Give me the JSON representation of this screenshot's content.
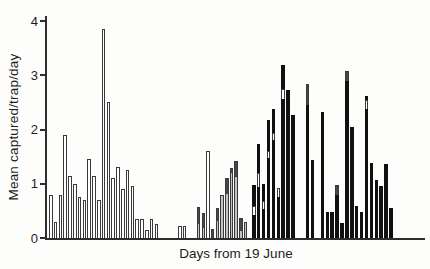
{
  "figure": {
    "kind": "scanned bar chart figure",
    "background": "#fdfdfc"
  },
  "chart_data": {
    "type": "bar",
    "title": "",
    "xlabel": "Days from 19 June",
    "ylabel": "Mean captured/trap/day",
    "ylim": [
      0,
      4
    ],
    "yticks": [
      0,
      1,
      2,
      3,
      4
    ],
    "x_tick_labels": "none shown",
    "grid": "off",
    "legend": "none",
    "bar_width_px": 3.6,
    "px_per_unit": 54.25,
    "baseline_y_px": 238,
    "colors": {
      "open": "#ffffff",
      "light": "#c3c3c3",
      "dark": "#474747",
      "black": "#101010",
      "outline": "#3a3a3a",
      "axis": "#2e2e2e"
    },
    "groups": [
      {
        "name": "period-1-open-bars",
        "fill_style": "open (white, outlined)",
        "bars": [
          {
            "x": 49.0,
            "segments": [
              [
                "open",
                0.8
              ]
            ]
          },
          {
            "x": 53.8,
            "segments": [
              [
                "open",
                0.3
              ]
            ]
          },
          {
            "x": 58.6,
            "segments": [
              [
                "open",
                0.8
              ]
            ]
          },
          {
            "x": 63.4,
            "segments": [
              [
                "open",
                1.9
              ]
            ]
          },
          {
            "x": 68.2,
            "segments": [
              [
                "open",
                1.15
              ]
            ]
          },
          {
            "x": 73.0,
            "segments": [
              [
                "open",
                1.0
              ]
            ]
          },
          {
            "x": 77.8,
            "segments": [
              [
                "open",
                0.75
              ]
            ]
          },
          {
            "x": 82.6,
            "segments": [
              [
                "open",
                0.7
              ]
            ]
          },
          {
            "x": 87.4,
            "segments": [
              [
                "open",
                1.45
              ]
            ]
          },
          {
            "x": 92.2,
            "segments": [
              [
                "open",
                1.15
              ]
            ]
          },
          {
            "x": 97.0,
            "segments": [
              [
                "open",
                0.7
              ]
            ]
          },
          {
            "x": 101.8,
            "segments": [
              [
                "open",
                3.85
              ]
            ]
          },
          {
            "x": 106.6,
            "segments": [
              [
                "open",
                2.5
              ]
            ]
          },
          {
            "x": 111.4,
            "segments": [
              [
                "open",
                1.1
              ]
            ]
          },
          {
            "x": 116.2,
            "segments": [
              [
                "open",
                1.3
              ]
            ]
          },
          {
            "x": 121.0,
            "segments": [
              [
                "open",
                0.9
              ]
            ]
          },
          {
            "x": 125.8,
            "segments": [
              [
                "open",
                1.25
              ]
            ]
          },
          {
            "x": 130.6,
            "segments": [
              [
                "open",
                0.95
              ]
            ]
          },
          {
            "x": 135.4,
            "segments": [
              [
                "open",
                0.35
              ]
            ]
          },
          {
            "x": 140.2,
            "segments": [
              [
                "open",
                0.35
              ]
            ]
          },
          {
            "x": 145.0,
            "segments": [
              [
                "open",
                0.15
              ]
            ]
          },
          {
            "x": 149.8,
            "segments": [
              [
                "open",
                0.35
              ]
            ]
          },
          {
            "x": 154.6,
            "segments": [
              [
                "open",
                0.25
              ]
            ]
          }
        ]
      },
      {
        "name": "period-2-gray-stacked-bars",
        "fill_style": "light gray with dark gray top segments; some open",
        "bars": [
          {
            "x": 178.0,
            "segments": [
              [
                "open",
                0.22
              ]
            ]
          },
          {
            "x": 182.7,
            "segments": [
              [
                "open",
                0.22
              ]
            ]
          },
          {
            "x": 196.8,
            "segments": [
              [
                "light",
                0.28
              ],
              [
                "dark",
                0.29
              ]
            ]
          },
          {
            "x": 201.5,
            "segments": [
              [
                "light",
                0.2
              ],
              [
                "dark",
                0.25
              ]
            ]
          },
          {
            "x": 206.2,
            "segments": [
              [
                "open",
                1.6
              ]
            ]
          },
          {
            "x": 210.9,
            "segments": [
              [
                "dark",
                0.17
              ]
            ]
          },
          {
            "x": 215.6,
            "segments": [
              [
                "light",
                0.34
              ],
              [
                "dark",
                0.23
              ]
            ]
          },
          {
            "x": 220.3,
            "segments": [
              [
                "light",
                0.8
              ]
            ]
          },
          {
            "x": 225.0,
            "segments": [
              [
                "light",
                0.83
              ],
              [
                "dark",
                0.27
              ]
            ]
          },
          {
            "x": 229.7,
            "segments": [
              [
                "light",
                1.22
              ],
              [
                "dark",
                0.08
              ]
            ]
          },
          {
            "x": 234.4,
            "segments": [
              [
                "light",
                1.15
              ],
              [
                "dark",
                0.28
              ]
            ]
          },
          {
            "x": 239.1,
            "segments": [
              [
                "light",
                0.15
              ],
              [
                "dark",
                0.23
              ]
            ]
          },
          {
            "x": 243.8,
            "segments": [
              [
                "light",
                0.3
              ]
            ]
          }
        ]
      },
      {
        "name": "period-3-black-bars",
        "fill_style": "solid black, some with white or dark-gray band segments",
        "bars": [
          {
            "x": 252.0,
            "segments": [
              [
                "black",
                0.43
              ],
              [
                "open",
                0.16
              ],
              [
                "black",
                0.39
              ]
            ]
          },
          {
            "x": 256.9,
            "segments": [
              [
                "black",
                0.94
              ],
              [
                "open",
                0.25
              ],
              [
                "black",
                0.53
              ]
            ]
          },
          {
            "x": 261.8,
            "segments": [
              [
                "black",
                0.53
              ],
              [
                "open",
                0.15
              ],
              [
                "black",
                0.32
              ]
            ]
          },
          {
            "x": 266.7,
            "segments": [
              [
                "black",
                1.48
              ],
              [
                "open",
                0.12
              ],
              [
                "black",
                0.57
              ]
            ]
          },
          {
            "x": 271.6,
            "segments": [
              [
                "black",
                1.81
              ],
              [
                "open",
                0.13
              ],
              [
                "black",
                0.44
              ]
            ]
          },
          {
            "x": 276.5,
            "segments": [
              [
                "black",
                0.75
              ],
              [
                "open",
                0.16
              ]
            ]
          },
          {
            "x": 281.4,
            "segments": [
              [
                "black",
                2.56
              ],
              [
                "open",
                0.19
              ],
              [
                "black",
                0.45
              ]
            ]
          },
          {
            "x": 286.3,
            "segments": [
              [
                "black",
                2.73
              ]
            ]
          },
          {
            "x": 291.2,
            "segments": [
              [
                "black",
                2.26
              ]
            ]
          },
          {
            "x": 305.9,
            "segments": [
              [
                "black",
                2.45
              ],
              [
                "dark",
                0.38
              ]
            ]
          },
          {
            "x": 310.8,
            "segments": [
              [
                "black",
                1.44
              ]
            ]
          },
          {
            "x": 320.6,
            "segments": [
              [
                "black",
                2.32
              ]
            ]
          },
          {
            "x": 325.5,
            "segments": [
              [
                "black",
                0.48
              ]
            ]
          },
          {
            "x": 330.4,
            "segments": [
              [
                "black",
                0.48
              ]
            ]
          },
          {
            "x": 335.3,
            "segments": [
              [
                "black",
                0.8
              ],
              [
                "dark",
                0.18
              ]
            ]
          },
          {
            "x": 340.2,
            "segments": [
              [
                "black",
                0.28
              ]
            ]
          },
          {
            "x": 345.1,
            "segments": [
              [
                "black",
                2.9
              ],
              [
                "dark",
                0.18
              ]
            ]
          },
          {
            "x": 350.0,
            "segments": [
              [
                "black",
                2.05
              ]
            ]
          },
          {
            "x": 354.9,
            "segments": [
              [
                "black",
                0.59
              ]
            ]
          },
          {
            "x": 359.8,
            "segments": [
              [
                "black",
                0.48
              ]
            ]
          },
          {
            "x": 364.7,
            "segments": [
              [
                "black",
                2.38
              ],
              [
                "open",
                0.16
              ],
              [
                "black",
                0.08
              ]
            ]
          },
          {
            "x": 369.6,
            "segments": [
              [
                "black",
                1.38
              ]
            ]
          },
          {
            "x": 374.5,
            "segments": [
              [
                "black",
                1.06
              ]
            ]
          },
          {
            "x": 379.4,
            "segments": [
              [
                "black",
                0.96
              ]
            ]
          },
          {
            "x": 384.3,
            "segments": [
              [
                "black",
                1.36
              ]
            ]
          },
          {
            "x": 389.2,
            "segments": [
              [
                "black",
                0.55
              ]
            ]
          }
        ]
      }
    ]
  }
}
